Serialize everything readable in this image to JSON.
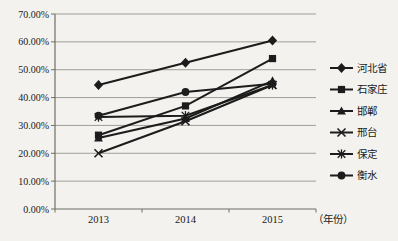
{
  "chart_data": {
    "type": "line",
    "title": "",
    "categories": [
      "2013",
      "2014",
      "2015"
    ],
    "xlabel": "（年份）",
    "ylabel": "",
    "ylim": [
      0,
      70
    ],
    "ytick_step": 10,
    "ytick_labels": [
      "0.00%",
      "10.00%",
      "20.00%",
      "30.00%",
      "40.00%",
      "50.00%",
      "60.00%",
      "70.00%"
    ],
    "grid": true,
    "legend_position": "right",
    "series": [
      {
        "name": "河北省",
        "marker": "diamond",
        "values": [
          44.5,
          52.5,
          60.5
        ]
      },
      {
        "name": "石家庄",
        "marker": "square",
        "values": [
          26.5,
          37.0,
          54.0
        ]
      },
      {
        "name": "邯郸",
        "marker": "triangle",
        "values": [
          25.5,
          32.5,
          46.0
        ]
      },
      {
        "name": "邢台",
        "marker": "x",
        "values": [
          20.0,
          31.5,
          44.5
        ]
      },
      {
        "name": "保定",
        "marker": "asterisk",
        "values": [
          33.0,
          33.5,
          44.5
        ]
      },
      {
        "name": "衡水",
        "marker": "circle",
        "values": [
          33.5,
          42.0,
          45.0
        ]
      }
    ]
  },
  "colors": {
    "background": "#f3f2ee",
    "line": "#1c1c1c",
    "grid": "#96958d",
    "axis": "#6f6e66",
    "text": "#1a1a1a"
  }
}
